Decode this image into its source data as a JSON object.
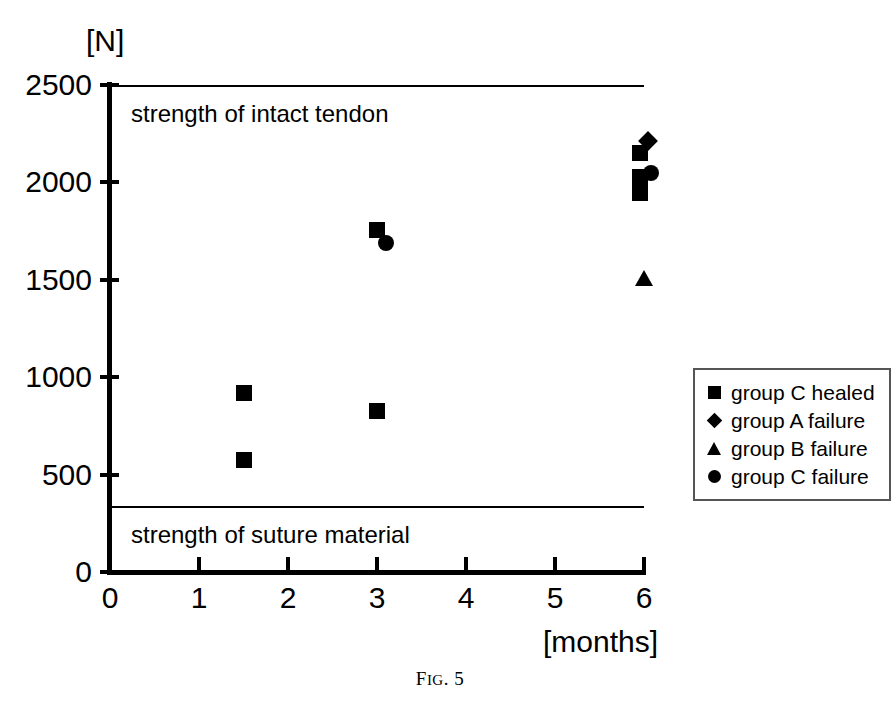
{
  "caption": {
    "prefix": "F",
    "small": "IG",
    "suffix": ". 5",
    "full": "FIG. 5"
  },
  "axes": {
    "y_title": "[N]",
    "x_title": "[months]",
    "y_ticks": [
      "0",
      "500",
      "1000",
      "1500",
      "2000",
      "2500"
    ],
    "x_ticks": [
      "0",
      "1",
      "2",
      "3",
      "4",
      "5",
      "6"
    ]
  },
  "reference_lines": [
    {
      "label": "strength of intact tendon",
      "value": 2500
    },
    {
      "label": "strength of suture material",
      "value": 340
    }
  ],
  "legend": {
    "items": [
      {
        "marker": "square-marker",
        "label": "group C healed"
      },
      {
        "marker": "diamond-marker",
        "label": "group A failure"
      },
      {
        "marker": "triangle-marker",
        "label": "group B failure"
      },
      {
        "marker": "circle-marker",
        "label": "group C failure"
      }
    ]
  },
  "chart_data": {
    "type": "scatter",
    "title": "FIG. 5",
    "xlabel": "[months]",
    "ylabel": "[N]",
    "xlim": [
      0,
      6
    ],
    "ylim": [
      0,
      2500
    ],
    "xticks": [
      0,
      1,
      2,
      3,
      4,
      5,
      6
    ],
    "yticks": [
      0,
      500,
      1000,
      1500,
      2000,
      2500
    ],
    "grid": false,
    "legend_position": "right",
    "reference_lines": [
      {
        "y": 2500,
        "label": "strength of intact tendon"
      },
      {
        "y": 340,
        "label": "strength of suture material"
      }
    ],
    "series": [
      {
        "name": "group C healed",
        "marker": "square",
        "points": [
          {
            "x": 1.5,
            "y": 920
          },
          {
            "x": 1.5,
            "y": 575
          },
          {
            "x": 3.0,
            "y": 1755
          },
          {
            "x": 3.0,
            "y": 825
          },
          {
            "x": 5.95,
            "y": 2150
          },
          {
            "x": 5.95,
            "y": 2030
          },
          {
            "x": 5.95,
            "y": 1945
          }
        ]
      },
      {
        "name": "group A failure",
        "marker": "diamond",
        "points": [
          {
            "x": 6.05,
            "y": 2215
          }
        ]
      },
      {
        "name": "group B failure",
        "marker": "triangle",
        "points": [
          {
            "x": 6.0,
            "y": 1510
          }
        ]
      },
      {
        "name": "group C failure",
        "marker": "circle",
        "points": [
          {
            "x": 3.1,
            "y": 1690
          },
          {
            "x": 6.08,
            "y": 2050
          }
        ]
      }
    ]
  }
}
